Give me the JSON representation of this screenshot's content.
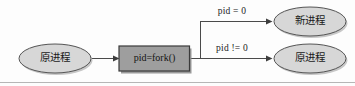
{
  "figure": {
    "background_color": "#fdfdfd",
    "baseline_rule_color": "#b6b6b6"
  },
  "nodes": {
    "source_process": {
      "label": "原进程",
      "shape": "ellipse",
      "fill": "#d7d7d7",
      "stroke": "#555555"
    },
    "fork_call": {
      "label": "pid=fork()",
      "shape": "rectangle",
      "fill": "#9e9e9e",
      "stroke": "#3b3b3b"
    },
    "child_process": {
      "label": "新进程",
      "shape": "ellipse",
      "fill": "#d7d7d7",
      "stroke": "#555555"
    },
    "parent_process": {
      "label": "原进程",
      "shape": "ellipse",
      "fill": "#d7d7d7",
      "stroke": "#555555"
    }
  },
  "edges": {
    "source_to_fork": {
      "label": ""
    },
    "fork_to_child": {
      "label": "pid = 0"
    },
    "fork_to_parent": {
      "label": "pid != 0"
    }
  }
}
